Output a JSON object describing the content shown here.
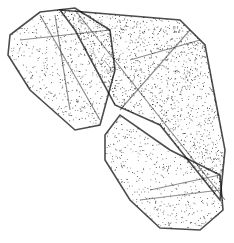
{
  "figure": {
    "background": "#ffffff",
    "point_color": "#000000",
    "lobes": [
      {
        "name": "upper-left-lobe",
        "outline": [
          [
            10,
            35
          ],
          [
            40,
            12
          ],
          [
            75,
            8
          ],
          [
            110,
            30
          ],
          [
            115,
            70
          ],
          [
            100,
            125
          ],
          [
            75,
            130
          ],
          [
            30,
            90
          ],
          [
            8,
            55
          ]
        ]
      },
      {
        "name": "upper-right-lobe",
        "outline": [
          [
            60,
            10
          ],
          [
            180,
            20
          ],
          [
            205,
            45
          ],
          [
            225,
            150
          ],
          [
            220,
            200
          ],
          [
            160,
            125
          ],
          [
            115,
            105
          ],
          [
            75,
            30
          ]
        ]
      },
      {
        "name": "lower-lobe",
        "outline": [
          [
            105,
            135
          ],
          [
            120,
            115
          ],
          [
            170,
            150
          ],
          [
            220,
            175
          ],
          [
            223,
            210
          ],
          [
            200,
            230
          ],
          [
            160,
            228
          ],
          [
            130,
            200
          ],
          [
            105,
            160
          ]
        ]
      }
    ]
  }
}
